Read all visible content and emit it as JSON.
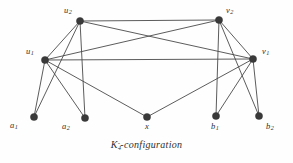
{
  "figure": {
    "caption": {
      "symbol": "K",
      "subscript": "4",
      "superscript": "-",
      "text": "-configuration",
      "full": "K4^- -configuration"
    },
    "background_color": "#fefefe",
    "vertex_color": "#3a3a3a",
    "edge_color": "#4a4a4a"
  },
  "graph": {
    "vertices": [
      {
        "id": "u2",
        "base": "u",
        "sub": "2",
        "cx": 80,
        "cy": 21,
        "label_x": 64,
        "label_y": 6,
        "r": 3.6
      },
      {
        "id": "v2",
        "base": "v",
        "sub": "2",
        "cx": 219,
        "cy": 20,
        "label_x": 226,
        "label_y": 6,
        "r": 3.6
      },
      {
        "id": "u1",
        "base": "u",
        "sub": "1",
        "cx": 45,
        "cy": 60,
        "label_x": 26,
        "label_y": 47,
        "r": 3.6
      },
      {
        "id": "v1",
        "base": "v",
        "sub": "1",
        "cx": 253,
        "cy": 59,
        "label_x": 262,
        "label_y": 47,
        "r": 3.6
      },
      {
        "id": "a1",
        "base": "a",
        "sub": "1",
        "cx": 34,
        "cy": 117,
        "label_x": 10,
        "label_y": 121,
        "r": 3.6
      },
      {
        "id": "a2",
        "base": "a",
        "sub": "2",
        "cx": 85,
        "cy": 118,
        "label_x": 62,
        "label_y": 122,
        "r": 3.6
      },
      {
        "id": "x",
        "base": "x",
        "sub": "",
        "cx": 147,
        "cy": 117,
        "label_x": 145,
        "label_y": 122,
        "r": 3.6
      },
      {
        "id": "b1",
        "base": "b",
        "sub": "1",
        "cx": 216,
        "cy": 116,
        "label_x": 211,
        "label_y": 122,
        "r": 3.6
      },
      {
        "id": "b2",
        "base": "b",
        "sub": "2",
        "cx": 259,
        "cy": 116,
        "label_x": 266,
        "label_y": 122,
        "r": 3.6
      }
    ],
    "edges": [
      {
        "from": "u2",
        "to": "v2"
      },
      {
        "from": "u2",
        "to": "u1"
      },
      {
        "from": "u2",
        "to": "v1"
      },
      {
        "from": "u2",
        "to": "a1"
      },
      {
        "from": "u2",
        "to": "a2"
      },
      {
        "from": "u1",
        "to": "v2"
      },
      {
        "from": "u1",
        "to": "v1"
      },
      {
        "from": "u1",
        "to": "a1"
      },
      {
        "from": "u1",
        "to": "a2"
      },
      {
        "from": "u1",
        "to": "x"
      },
      {
        "from": "v2",
        "to": "v1"
      },
      {
        "from": "v2",
        "to": "b1"
      },
      {
        "from": "v2",
        "to": "b2"
      },
      {
        "from": "v1",
        "to": "b1"
      },
      {
        "from": "v1",
        "to": "b2"
      },
      {
        "from": "v1",
        "to": "x"
      }
    ]
  }
}
